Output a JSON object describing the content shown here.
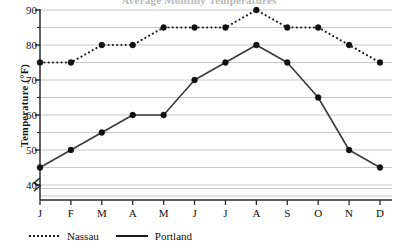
{
  "chart_data": {
    "type": "line",
    "title": "Average Monthly Temperatures",
    "xlabel": "",
    "ylabel": "Temperature (°F)",
    "ylim": [
      35,
      90
    ],
    "ytick_labels": [
      "40",
      "50",
      "60",
      "70",
      "80",
      "90"
    ],
    "ytick_values": [
      40,
      50,
      60,
      70,
      80,
      90
    ],
    "grid": true,
    "grid_step": 5,
    "axis_break": true,
    "legend_position": "bottom-left",
    "categories": [
      "J",
      "F",
      "M",
      "A",
      "M",
      "J",
      "J",
      "A",
      "S",
      "O",
      "N",
      "D"
    ],
    "series": [
      {
        "name": "Nassau",
        "style": "dotted",
        "marker": "filled-circle",
        "color": "#1a1a1a",
        "values": [
          75,
          75,
          80,
          80,
          85,
          85,
          85,
          90,
          85,
          85,
          80,
          75
        ]
      },
      {
        "name": "Portland",
        "style": "solid",
        "marker": "filled-circle",
        "color": "#3a3a3a",
        "values": [
          45,
          50,
          55,
          60,
          60,
          70,
          75,
          80,
          75,
          65,
          50,
          45
        ]
      }
    ]
  },
  "colors": {
    "grid": "#c8c8c8",
    "axis": "#2b2b2b",
    "text": "#111111",
    "background": "#ffffff"
  }
}
